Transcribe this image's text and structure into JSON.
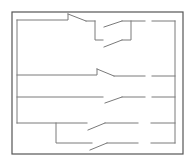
{
  "diagram": {
    "type": "ladder-circuit",
    "colors": {
      "background": "#ffffff",
      "frame": "#555555",
      "wire": "#7a7a7a"
    },
    "frame": {
      "x": 12,
      "y": 12,
      "width": 171,
      "height": 142
    },
    "left_rail": {
      "x": 17,
      "y1": 20,
      "y2": 123
    },
    "right_rail": {
      "x": 175,
      "y1": 21,
      "y2": 143
    },
    "rungs": [
      {
        "id": "rung-1",
        "y": 21,
        "contacts": [
          {
            "kind": "normally-closed",
            "label": ""
          },
          {
            "kind": "normally-open-parallel-branch",
            "label": ""
          }
        ],
        "output_gap": [
          145,
          152
        ]
      },
      {
        "id": "rung-2",
        "y": 75,
        "contacts": [
          {
            "kind": "normally-closed",
            "label": ""
          }
        ],
        "output_gap": [
          145,
          152
        ]
      },
      {
        "id": "rung-3",
        "y": 97,
        "contacts": [
          {
            "kind": "normally-open",
            "label": ""
          }
        ],
        "output_gap": [
          145,
          152
        ]
      },
      {
        "id": "rung-4",
        "y": 123,
        "contacts": [
          {
            "kind": "normally-open",
            "label": ""
          }
        ],
        "output_gap": [
          138,
          152
        ]
      },
      {
        "id": "rung-5",
        "y": 143,
        "contacts": [
          {
            "kind": "normally-open",
            "label": ""
          }
        ],
        "output_gap": [
          138,
          152
        ]
      }
    ]
  }
}
